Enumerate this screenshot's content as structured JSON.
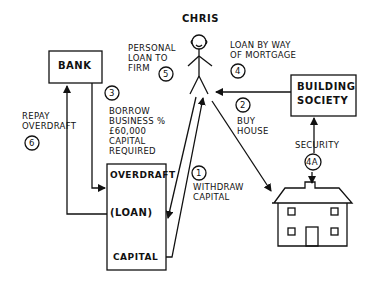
{
  "nodes": {
    "person": {
      "label": "CHRIS"
    },
    "bank": {
      "label": "BANK"
    },
    "building_society": {
      "label": "BUILDING\nSOCIETY"
    },
    "business": {
      "rows": [
        "OVERDRAFT",
        "(LOAN)",
        "CAPITAL"
      ]
    },
    "house": {
      "label": ""
    }
  },
  "edges": [
    {
      "id": "1",
      "text": "WITHDRAW\nCAPITAL",
      "from": "business",
      "to": "person"
    },
    {
      "id": "2",
      "text": "BUY\nHOUSE",
      "from": "person",
      "to": "house"
    },
    {
      "id": "3",
      "text": "BORROW\nBUSINESS %\n£60,000\nCAPITAL\nREQUIRED",
      "from": "bank",
      "to": "business"
    },
    {
      "id": "4",
      "text": "LOAN BY WAY\nOF MORTGAGE",
      "from": "building_society",
      "to": "person"
    },
    {
      "id": "4A",
      "text": "SECURITY",
      "from": "house",
      "to": "building_society"
    },
    {
      "id": "5",
      "text": "PERSONAL\nLOAN TO\nFIRM",
      "from": "person",
      "to": "business"
    },
    {
      "id": "6",
      "text": "REPAY\nOVERDRAFT",
      "from": "business",
      "to": "bank"
    }
  ]
}
